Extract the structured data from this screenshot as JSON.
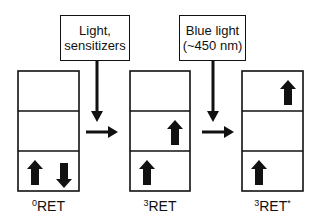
{
  "figure": {
    "colors": {
      "line": "#111111",
      "background": "#ffffff"
    },
    "states": [
      {
        "id": "0RET",
        "label_sup": "0",
        "label_main": "RET",
        "label_suffix": "",
        "box": {
          "x": 18,
          "y": 71,
          "w": 61,
          "h": 120
        },
        "levels": [
          {
            "index": "top",
            "arrows": []
          },
          {
            "index": "middle",
            "arrows": []
          },
          {
            "index": "bottom",
            "arrows": [
              {
                "dir": "up",
                "pos": "left"
              },
              {
                "dir": "down",
                "pos": "right"
              }
            ]
          }
        ]
      },
      {
        "id": "3RET",
        "label_sup": "3",
        "label_main": "RET",
        "label_suffix": "",
        "box": {
          "x": 130,
          "y": 71,
          "w": 60,
          "h": 120
        },
        "levels": [
          {
            "index": "top",
            "arrows": []
          },
          {
            "index": "middle",
            "arrows": [
              {
                "dir": "up",
                "pos": "right"
              }
            ]
          },
          {
            "index": "bottom",
            "arrows": [
              {
                "dir": "up",
                "pos": "left"
              }
            ]
          }
        ]
      },
      {
        "id": "3RET*",
        "label_sup": "3",
        "label_main": "RET",
        "label_suffix": "*",
        "box": {
          "x": 242,
          "y": 71,
          "w": 61,
          "h": 120
        },
        "levels": [
          {
            "index": "top",
            "arrows": [
              {
                "dir": "up",
                "pos": "right"
              }
            ]
          },
          {
            "index": "middle",
            "arrows": []
          },
          {
            "index": "bottom",
            "arrows": [
              {
                "dir": "up",
                "pos": "left"
              }
            ]
          }
        ]
      }
    ],
    "conditions": [
      {
        "line1": "Light,",
        "line2": "sensitizers",
        "box": {
          "x": 60,
          "y": 15,
          "w": 70,
          "h": 46
        },
        "drop_x": 97,
        "arrow_y": 132,
        "arrow_x1": 86,
        "arrow_x2": 118
      },
      {
        "line1": "Blue light",
        "line2": "(~450 nm)",
        "box": {
          "x": 179,
          "y": 15,
          "w": 67,
          "h": 46
        },
        "drop_x": 213,
        "arrow_y": 132,
        "arrow_x1": 202,
        "arrow_x2": 234
      }
    ]
  }
}
